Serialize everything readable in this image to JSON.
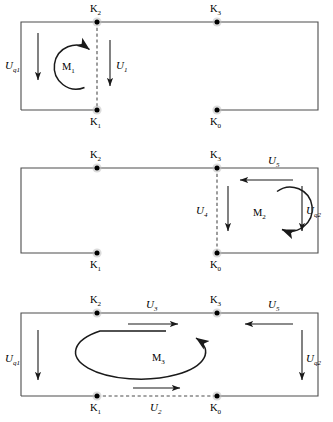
{
  "figure": {
    "type": "circuit-mesh-diagram",
    "panel_count": 3,
    "node_labels": {
      "k0": "K",
      "k1": "K",
      "k2": "K",
      "k3": "K"
    },
    "node_subscripts": {
      "k0": "0",
      "k1": "1",
      "k2": "2",
      "k3": "3"
    }
  },
  "colors": {
    "wire": "#4d4d4d",
    "arrow": "#1a1a1a",
    "node": "#000000",
    "node_halo": "#bdbdbd",
    "background": "#ffffff"
  },
  "panels": [
    {
      "id": "panel-1",
      "name": "mesh-1",
      "loop": {
        "label": "M",
        "subscript": "1",
        "direction": "counterclockwise",
        "shape": "circle"
      },
      "nodes": [
        {
          "name": "K2",
          "label": "K",
          "subscript": "2",
          "label_position": "above"
        },
        {
          "name": "K3",
          "label": "K",
          "subscript": "3",
          "label_position": "above"
        },
        {
          "name": "K1",
          "label": "K",
          "subscript": "1",
          "label_position": "below"
        },
        {
          "name": "K0",
          "label": "K",
          "subscript": "0",
          "label_position": "below"
        }
      ],
      "arrows": [
        {
          "name": "Uq1",
          "label": "U",
          "subscript": "q1",
          "direction": "down",
          "edge": "left"
        },
        {
          "name": "U1",
          "label": "U",
          "subscript": "1",
          "direction": "down",
          "edge": "branch-K2-K1"
        }
      ],
      "dashed_branch": "K2-K1",
      "open_gap": "bottom edge between K1 and K0"
    },
    {
      "id": "panel-2",
      "name": "mesh-2",
      "loop": {
        "label": "M",
        "subscript": "2",
        "direction": "counterclockwise",
        "shape": "circle"
      },
      "nodes": [
        {
          "name": "K2",
          "label": "K",
          "subscript": "2",
          "label_position": "above"
        },
        {
          "name": "K3",
          "label": "K",
          "subscript": "3",
          "label_position": "above"
        },
        {
          "name": "K1",
          "label": "K",
          "subscript": "1",
          "label_position": "below"
        },
        {
          "name": "K0",
          "label": "K",
          "subscript": "0",
          "label_position": "below"
        }
      ],
      "arrows": [
        {
          "name": "U5",
          "label": "U",
          "subscript": "5",
          "direction": "left",
          "edge": "top-right"
        },
        {
          "name": "U4",
          "label": "U",
          "subscript": "4",
          "direction": "down",
          "edge": "branch-K3-K0"
        },
        {
          "name": "Uq2",
          "label": "U",
          "subscript": "q2",
          "direction": "down",
          "edge": "right"
        }
      ],
      "dashed_branch": "K3-K0",
      "open_gap": "bottom edge between K1 and K0"
    },
    {
      "id": "panel-3",
      "name": "mesh-3",
      "loop": {
        "label": "M",
        "subscript": "3",
        "direction": "counterclockwise",
        "shape": "ellipse"
      },
      "nodes": [
        {
          "name": "K2",
          "label": "K",
          "subscript": "2",
          "label_position": "above"
        },
        {
          "name": "K3",
          "label": "K",
          "subscript": "3",
          "label_position": "above"
        },
        {
          "name": "K1",
          "label": "K",
          "subscript": "1",
          "label_position": "below"
        },
        {
          "name": "K0",
          "label": "K",
          "subscript": "0",
          "label_position": "below"
        }
      ],
      "arrows": [
        {
          "name": "U3",
          "label": "U",
          "subscript": "3",
          "direction": "right",
          "edge": "top K2-K3"
        },
        {
          "name": "U5",
          "label": "U",
          "subscript": "5",
          "direction": "left",
          "edge": "top-right"
        },
        {
          "name": "Uq1",
          "label": "U",
          "subscript": "q1",
          "direction": "down",
          "edge": "left"
        },
        {
          "name": "Uq2",
          "label": "U",
          "subscript": "q2",
          "direction": "down",
          "edge": "right"
        },
        {
          "name": "U2",
          "label": "U",
          "subscript": "2",
          "direction": "right",
          "edge": "bottom K1-K0"
        }
      ],
      "dashed_branch": "K1-K0",
      "open_gap": "none"
    }
  ]
}
